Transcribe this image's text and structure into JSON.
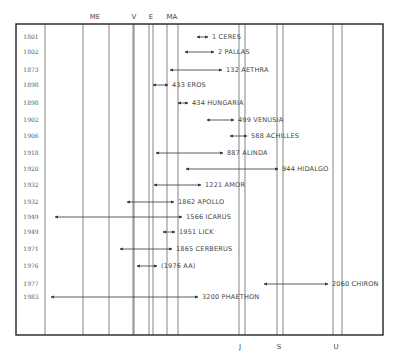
{
  "chart_data": {
    "type": "diagram",
    "title": "",
    "frame": {
      "left": 16,
      "top": 24,
      "right": 383,
      "bottom": 335
    },
    "planets": [
      {
        "label": "ME",
        "lines": [
          45,
          83
        ],
        "label_x": 95,
        "position": "top"
      },
      {
        "label": "V",
        "lines": [
          109,
          133
        ],
        "label_x": 134,
        "position": "top"
      },
      {
        "label": "E",
        "lines": [
          134,
          149
        ],
        "label_x": 151,
        "position": "top"
      },
      {
        "label": "MA",
        "lines": [
          153,
          167
        ],
        "label_x": 172,
        "position": "top"
      },
      {
        "label": "",
        "lines": [
          178
        ],
        "label_x": null,
        "position": "top"
      },
      {
        "label": "J",
        "lines": [
          239,
          245
        ],
        "label_x": 240,
        "position": "bottom"
      },
      {
        "label": "S",
        "lines": [
          277,
          283
        ],
        "label_x": 279,
        "position": "bottom"
      },
      {
        "label": "U",
        "lines": [
          333,
          342
        ],
        "label_x": 336,
        "position": "bottom"
      }
    ],
    "asteroids": [
      {
        "year": "1801",
        "name": "1 CERES",
        "y": 37,
        "x1": 197,
        "x2": 208
      },
      {
        "year": "1802",
        "name": "2 PALLAS",
        "y": 52,
        "x1": 185,
        "x2": 214
      },
      {
        "year": "1873",
        "name": "132 AETHRA",
        "y": 70,
        "x1": 170,
        "x2": 222
      },
      {
        "year": "1898",
        "name": "433 EROS",
        "y": 85,
        "x1": 153,
        "x2": 168
      },
      {
        "year": "1898",
        "name": "434 HUNGARIA",
        "y": 103,
        "x1": 178,
        "x2": 188
      },
      {
        "year": "1902",
        "name": "499 VENUSIA",
        "y": 120,
        "x1": 207,
        "x2": 234
      },
      {
        "year": "1906",
        "name": "588 ACHILLES",
        "y": 136,
        "x1": 230,
        "x2": 247
      },
      {
        "year": "1918",
        "name": "887 ALINDA",
        "y": 153,
        "x1": 156,
        "x2": 223
      },
      {
        "year": "1920",
        "name": "944 HIDALGO",
        "y": 169,
        "x1": 186,
        "x2": 278
      },
      {
        "year": "1932",
        "name": "1221 AMOR",
        "y": 185,
        "x1": 154,
        "x2": 201
      },
      {
        "year": "1932",
        "name": "1862 APOLLO",
        "y": 202,
        "x1": 127,
        "x2": 174
      },
      {
        "year": "1949",
        "name": "1566 ICARUS",
        "y": 217,
        "x1": 55,
        "x2": 182
      },
      {
        "year": "1949",
        "name": "1951 LICK",
        "y": 232,
        "x1": 163,
        "x2": 175
      },
      {
        "year": "1971",
        "name": "1865 CERBERUS",
        "y": 249,
        "x1": 120,
        "x2": 172
      },
      {
        "year": "1976",
        "name": "(1976 AA)",
        "y": 266,
        "x1": 137,
        "x2": 157
      },
      {
        "year": "1977",
        "name": "2060 CHIRON",
        "y": 284,
        "x1": 264,
        "x2": 328
      },
      {
        "year": "1983",
        "name": "3200 PHAETHON",
        "y": 297,
        "x1": 51,
        "x2": 198
      }
    ]
  },
  "colors": {
    "line": "#333333",
    "frame": "#222222",
    "text": "#444444",
    "background": "#ffffff"
  }
}
